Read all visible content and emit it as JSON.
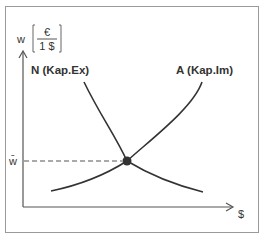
{
  "diagram": {
    "type": "supply-demand",
    "y_axis": {
      "label": "w",
      "unit_numerator": "€",
      "unit_denominator": "1 $"
    },
    "x_axis": {
      "label": "$"
    },
    "curves": [
      {
        "id": "N",
        "label": "N (Kap.Ex)",
        "shape": "downward-sloping"
      },
      {
        "id": "A",
        "label": "A (Kap.Im)",
        "shape": "upward-sloping"
      }
    ],
    "equilibrium": {
      "label": "w̄"
    },
    "colors": {
      "curve": "#333333",
      "axis": "#555555",
      "frame": "#9a9a9a"
    }
  }
}
